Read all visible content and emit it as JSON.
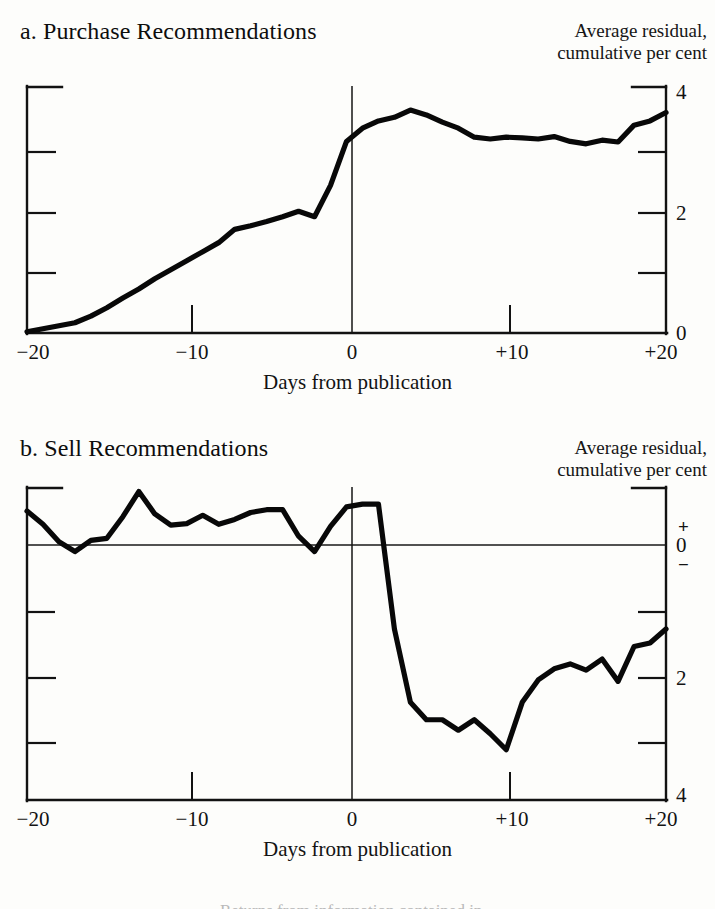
{
  "document": {
    "background_color": "#fdfdfb",
    "ink_color": "#111111",
    "footer_partial_text": "Returns from information contained in..."
  },
  "panels": [
    {
      "id": "purchase",
      "title": "a. Purchase Recommendations",
      "axis_caption_line1": "Average residual,",
      "axis_caption_line2": "cumulative per cent",
      "x_title": "Days from publication",
      "x_tick_labels": [
        "−20",
        "−10",
        "0",
        "+10",
        "+20"
      ],
      "y_tick_labels": [
        "4",
        "2",
        "0"
      ],
      "event_line_label": "0"
    },
    {
      "id": "sell",
      "title": "b. Sell Recommendations",
      "axis_caption_line1": "Average residual,",
      "axis_caption_line2": "cumulative per cent",
      "x_title": "Days from publication",
      "y_tick_labels": [
        "0",
        "2",
        "4"
      ],
      "x_tick_labels": [
        "−20",
        "−10",
        "0",
        "+10",
        "+20"
      ],
      "plus_sign": "+",
      "minus_sign": "−",
      "event_line_label": "0"
    }
  ],
  "chart_data": [
    {
      "type": "line",
      "id": "purchase",
      "title": "a. Purchase Recommendations",
      "subtitle": "Average residual, cumulative per cent",
      "xlabel": "Days from publication",
      "ylabel": "Average residual, cumulative per cent",
      "xlim": [
        -20,
        20
      ],
      "ylim": [
        0,
        4
      ],
      "xticks": [
        -20,
        -10,
        0,
        10,
        20
      ],
      "xticklabels": [
        "−20",
        "−10",
        "0",
        "+10",
        "+20"
      ],
      "yticks": [
        0,
        2,
        4
      ],
      "yticklabels": [
        "0",
        "2",
        "4"
      ],
      "yminorticks": [
        1,
        3
      ],
      "grid": false,
      "legend": false,
      "event_line_x": 0,
      "x": [
        -20,
        -19,
        -18,
        -17,
        -16,
        -15,
        -14,
        -13,
        -12,
        -11,
        -10,
        -9,
        -8,
        -7,
        -6,
        -5,
        -4,
        -3,
        -2,
        -1,
        0,
        1,
        2,
        3,
        4,
        5,
        6,
        7,
        8,
        9,
        10,
        11,
        12,
        13,
        14,
        15,
        16,
        17,
        18,
        19,
        20
      ],
      "y": [
        0.02,
        0.07,
        0.12,
        0.17,
        0.28,
        0.42,
        0.58,
        0.73,
        0.9,
        1.05,
        1.2,
        1.35,
        1.5,
        1.72,
        1.78,
        1.85,
        1.93,
        2.02,
        1.93,
        2.45,
        3.18,
        3.4,
        3.52,
        3.58,
        3.7,
        3.62,
        3.5,
        3.4,
        3.25,
        3.22,
        3.25,
        3.24,
        3.22,
        3.26,
        3.18,
        3.14,
        3.2,
        3.17,
        3.45,
        3.52,
        3.66,
        3.46
      ],
      "series": [
        {
          "name": "Average cumulative residual, purchase recommendations",
          "values": [
            0.02,
            0.07,
            0.12,
            0.17,
            0.28,
            0.42,
            0.58,
            0.73,
            0.9,
            1.05,
            1.2,
            1.35,
            1.5,
            1.72,
            1.78,
            1.85,
            1.93,
            2.02,
            1.93,
            2.45,
            3.18,
            3.4,
            3.52,
            3.58,
            3.7,
            3.62,
            3.5,
            3.4,
            3.25,
            3.22,
            3.25,
            3.24,
            3.22,
            3.26,
            3.18,
            3.14,
            3.2,
            3.17,
            3.45,
            3.52,
            3.66
          ]
        }
      ],
      "notes": "Residual rises gradually before publication, jumps sharply on day 0, peaks near +4 days at about 3.7 per cent, then drifts sideways around 3.2 to 3.5."
    },
    {
      "type": "line",
      "id": "sell",
      "title": "b. Sell Recommendations",
      "subtitle": "Average residual, cumulative per cent",
      "xlabel": "Days from publication",
      "ylabel": "Average residual, cumulative per cent",
      "xlim": [
        -20,
        20
      ],
      "ylim": [
        -4,
        0.6
      ],
      "xticks": [
        -20,
        -10,
        0,
        10,
        20
      ],
      "xticklabels": [
        "−20",
        "−10",
        "0",
        "+10",
        "+20"
      ],
      "yticks": [
        0,
        -2,
        -4
      ],
      "yticklabels": [
        "0",
        "2",
        "4"
      ],
      "yminorticks": [
        -1,
        -3
      ],
      "grid": false,
      "legend": false,
      "event_line_x": 0,
      "zero_line": true,
      "x": [
        -20,
        -19,
        -18,
        -17,
        -16,
        -15,
        -14,
        -13,
        -12,
        -11,
        -10,
        -9,
        -8,
        -7,
        -6,
        -5,
        -4,
        -3,
        -2,
        -1,
        0,
        1,
        2,
        3,
        4,
        5,
        6,
        7,
        8,
        9,
        10,
        11,
        12,
        13,
        14,
        15,
        16,
        17,
        18,
        19,
        20
      ],
      "y": [
        0.14,
        -0.05,
        -0.3,
        -0.44,
        -0.28,
        -0.25,
        0.06,
        0.42,
        0.1,
        -0.06,
        -0.04,
        0.08,
        -0.05,
        0.02,
        0.12,
        0.16,
        0.16,
        -0.22,
        -0.44,
        -0.08,
        0.2,
        0.24,
        0.24,
        -1.55,
        -2.6,
        -2.85,
        -2.85,
        -3.0,
        -2.85,
        -3.05,
        -3.28,
        -2.6,
        -2.28,
        -2.12,
        -2.05,
        -2.14,
        -1.98,
        -2.3,
        -1.8,
        -1.75,
        -1.55,
        -1.68,
        -1.82,
        -1.72
      ],
      "series": [
        {
          "name": "Average cumulative residual, sell recommendations",
          "values": [
            0.14,
            -0.05,
            -0.3,
            -0.44,
            -0.28,
            -0.25,
            0.06,
            0.42,
            0.1,
            -0.06,
            -0.04,
            0.08,
            -0.05,
            0.02,
            0.12,
            0.16,
            0.16,
            -0.22,
            -0.44,
            -0.08,
            0.2,
            0.24,
            -2.6,
            -2.85,
            -2.85,
            -3.0,
            -2.85,
            -3.28,
            -2.6,
            -2.28,
            -2.12,
            -2.05,
            -2.14,
            -1.98,
            -2.3,
            -1.8,
            -1.75,
            -1.55,
            -1.68,
            -1.82,
            -1.72
          ]
        }
      ],
      "notes": "Residual oscillates around zero before publication, drops abruptly just before day 0 to about minus 3 per cent, bottoms near day +6 at about minus 3.3, then partially recovers to about minus 1.7 by day +20."
    }
  ]
}
